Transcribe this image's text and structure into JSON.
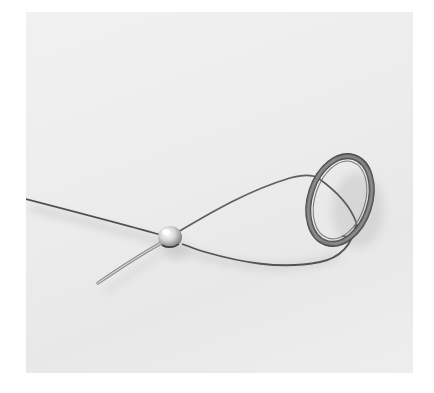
{
  "image": {
    "description": "Close-up photograph of a thin metal wire threaded through a small silver bead, looped around a polished metal jump ring on a pale grey textured background",
    "colors": {
      "background": "#ececec",
      "wire": "#5a5a5a",
      "wire_highlight": "#9a9a9a",
      "ring_dark": "#3a3a3a",
      "ring_light": "#d8d8d8",
      "bead": "#cfcfcf",
      "shadow": "#c4c4c4"
    }
  }
}
